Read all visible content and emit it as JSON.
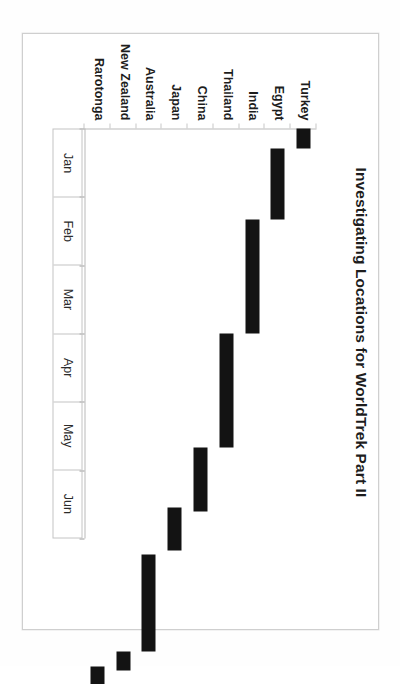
{
  "document": {
    "type": "scanned-page",
    "page_background": "#ffffff",
    "border_color": "#cfcfcf"
  },
  "chart_data": {
    "type": "bar",
    "subtype": "gantt",
    "orientation": "horizontal-bars-rotated-90cw",
    "title": "Investigating Locations for WorldTrek Part II",
    "xlabel": "",
    "ylabel": "",
    "grid": false,
    "legend": null,
    "bar_color": "#131313",
    "axis_color": "#b9b9b9",
    "x_axis": {
      "kind": "time",
      "tick_labels": [
        "Jan",
        "Feb",
        "Mar",
        "Apr",
        "May",
        "Jun"
      ],
      "range_months": [
        0,
        6
      ],
      "ticks_per_label": 1
    },
    "categories": [
      "Turkey",
      "Egypt",
      "India",
      "Thailand",
      "China",
      "Japan",
      "Australia",
      "New Zealand",
      "Rarotonga"
    ],
    "bars": [
      {
        "category": "Turkey",
        "start_month": 0.0,
        "end_month": 0.48,
        "start_label": "Jan",
        "end_label": "mid Jan"
      },
      {
        "category": "Egypt",
        "start_month": 0.48,
        "end_month": 1.7,
        "start_label": "mid Jan",
        "end_label": "late Feb"
      },
      {
        "category": "India",
        "start_month": 1.7,
        "end_month": 3.66,
        "start_label": "late Feb",
        "end_label": "late Apr"
      },
      {
        "category": "Thailand",
        "start_month": 3.66,
        "end_month": 5.61,
        "start_label": "late Apr",
        "end_label": "mid Jun"
      },
      {
        "category": "China",
        "start_month": 5.61,
        "end_month": 6.71,
        "start_label": "mid Jun",
        "end_label": "late Jun"
      },
      {
        "category": "Japan",
        "start_month": 6.66,
        "end_month": 7.39,
        "start_label": "late Jun",
        "end_label": "Jul"
      },
      {
        "category": "Australia",
        "start_month": 7.49,
        "end_month": 9.15,
        "start_label": "Jul",
        "end_label": "Sep"
      },
      {
        "category": "New Zealand",
        "start_month": 9.1,
        "end_month": 9.41,
        "start_label": "Sep",
        "end_label": "Sep"
      },
      {
        "category": "Rarotonga",
        "start_month": 9.34,
        "end_month": 9.66,
        "start_label": "Sep",
        "end_label": "Sep"
      }
    ],
    "bar_pixel_extents_note": "Positions expressed as fraction of the plotted time span; axis shows 6 labelled months across the band."
  },
  "layout": {
    "bar_fractions": [
      {
        "left": 0.0,
        "width": 0.049
      },
      {
        "left": 0.049,
        "width": 0.173
      },
      {
        "left": 0.222,
        "width": 0.278
      },
      {
        "left": 0.5,
        "width": 0.278
      },
      {
        "left": 0.778,
        "width": 0.156
      },
      {
        "left": 0.925,
        "width": 0.104
      },
      {
        "left": 1.039,
        "width": 0.237
      },
      {
        "left": 1.276,
        "width": 0.045
      },
      {
        "left": 1.311,
        "width": 0.045
      }
    ]
  }
}
